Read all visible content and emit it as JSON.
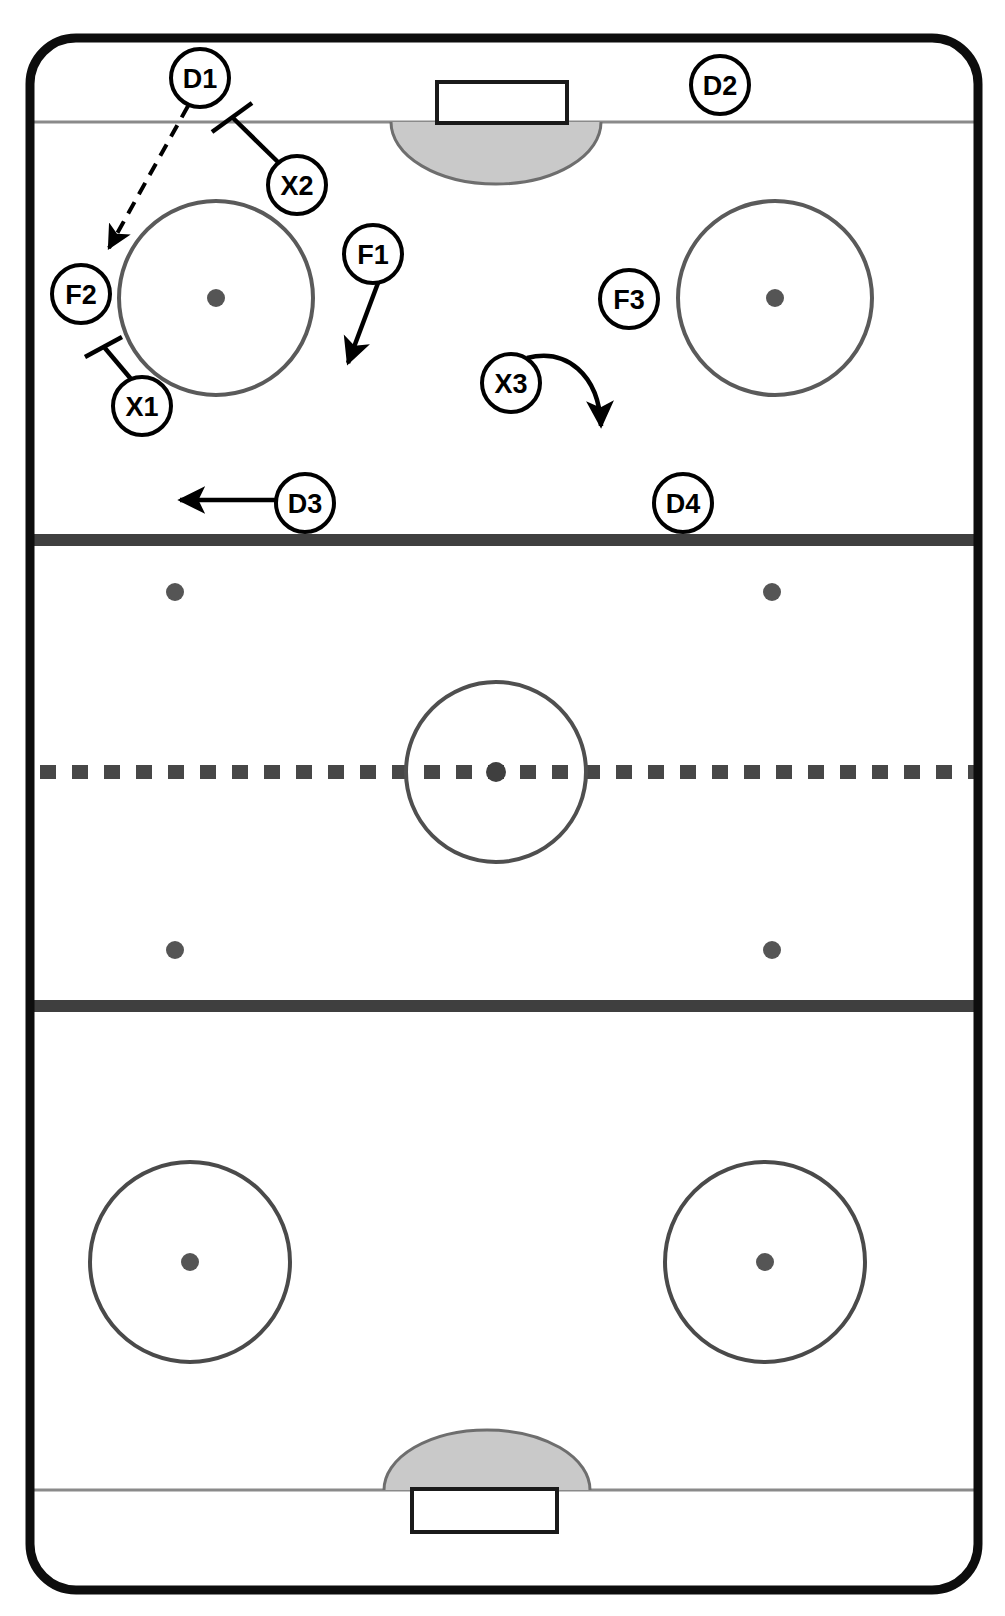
{
  "diagram": {
    "kind": "ice-hockey-rink-play-diagram",
    "title": "",
    "width": 1005,
    "height": 1616
  },
  "colors": {
    "ice": "#ffffff",
    "board": "#000000",
    "line": "#4a4a4a",
    "thin_line": "#808080",
    "crease_fill": "#c8c8c8",
    "crease_stroke": "#707070",
    "marker_stroke": "#000000",
    "marker_fill": "#ffffff",
    "dot_fill": "#555555",
    "arrow": "#000000"
  },
  "rink": {
    "boards": {
      "x": 30,
      "y": 38,
      "width": 948,
      "height": 1552,
      "corner_radius": 46,
      "stroke_width": 9
    },
    "goal_lines": [
      {
        "name": "top-goal-line",
        "y": 122
      },
      {
        "name": "bottom-goal-line",
        "y": 1490
      }
    ],
    "blue_lines": [
      {
        "name": "top-blue-line",
        "y": 540,
        "thickness": 11
      },
      {
        "name": "bottom-blue-line",
        "y": 1006,
        "thickness": 11
      }
    ],
    "center_line": {
      "name": "center-red-line",
      "y": 772,
      "thickness": 13,
      "style": "dashed"
    },
    "center_circle": {
      "cx": 496,
      "cy": 772,
      "r": 90
    },
    "center_dot": {
      "cx": 496,
      "cy": 772,
      "r": 9
    },
    "goals": [
      {
        "name": "top-goal",
        "x": 437,
        "y": 82,
        "width": 130,
        "height": 40
      },
      {
        "name": "bottom-goal",
        "x": 412,
        "y": 1490,
        "width": 145,
        "height": 42
      }
    ],
    "creases": [
      {
        "name": "top-crease",
        "cx": 496,
        "cy": 122,
        "rx": 105,
        "ry": 62,
        "side": "below"
      },
      {
        "name": "bottom-crease",
        "cx": 487,
        "cy": 1490,
        "rx": 103,
        "ry": 60,
        "side": "above"
      }
    ],
    "faceoff_circles": [
      {
        "name": "faceoff-circle-top-left",
        "cx": 216,
        "cy": 298,
        "r": 97
      },
      {
        "name": "faceoff-circle-top-right",
        "cx": 775,
        "cy": 298,
        "r": 97
      },
      {
        "name": "faceoff-circle-bottom-left",
        "cx": 190,
        "cy": 1262,
        "r": 100
      },
      {
        "name": "faceoff-circle-bottom-right",
        "cx": 765,
        "cy": 1262,
        "r": 100
      }
    ],
    "faceoff_dots": [
      {
        "name": "faceoff-dot-top-left",
        "cx": 216,
        "cy": 298,
        "r": 9
      },
      {
        "name": "faceoff-dot-top-right",
        "cx": 775,
        "cy": 298,
        "r": 9
      },
      {
        "name": "faceoff-dot-bottom-left",
        "cx": 190,
        "cy": 1262,
        "r": 9
      },
      {
        "name": "faceoff-dot-bottom-right",
        "cx": 765,
        "cy": 1262,
        "r": 9
      },
      {
        "name": "neutral-dot-top-left",
        "cx": 175,
        "cy": 592,
        "r": 9
      },
      {
        "name": "neutral-dot-top-right",
        "cx": 772,
        "cy": 592,
        "r": 9
      },
      {
        "name": "neutral-dot-bottom-left",
        "cx": 175,
        "cy": 950,
        "r": 9
      },
      {
        "name": "neutral-dot-bottom-right",
        "cx": 772,
        "cy": 950,
        "r": 9
      }
    ]
  },
  "players": [
    {
      "id": "D1",
      "label": "D1",
      "cx": 200,
      "cy": 78,
      "r": 29,
      "team": "defense"
    },
    {
      "id": "D2",
      "label": "D2",
      "cx": 720,
      "cy": 85,
      "r": 29,
      "team": "defense"
    },
    {
      "id": "D3",
      "label": "D3",
      "cx": 305,
      "cy": 503,
      "r": 29,
      "team": "defense"
    },
    {
      "id": "D4",
      "label": "D4",
      "cx": 683,
      "cy": 503,
      "r": 29,
      "team": "defense"
    },
    {
      "id": "F1",
      "label": "F1",
      "cx": 373,
      "cy": 254,
      "r": 29,
      "team": "forward"
    },
    {
      "id": "F2",
      "label": "F2",
      "cx": 81,
      "cy": 294,
      "r": 29,
      "team": "forward"
    },
    {
      "id": "F3",
      "label": "F3",
      "cx": 629,
      "cy": 299,
      "r": 29,
      "team": "forward"
    },
    {
      "id": "X1",
      "label": "X1",
      "cx": 142,
      "cy": 406,
      "r": 29,
      "team": "opponent"
    },
    {
      "id": "X2",
      "label": "X2",
      "cx": 297,
      "cy": 185,
      "r": 29,
      "team": "opponent"
    },
    {
      "id": "X3",
      "label": "X3",
      "cx": 511,
      "cy": 383,
      "r": 29,
      "team": "opponent"
    }
  ],
  "movements": [
    {
      "name": "pass-d1-to-f2",
      "from": "D1",
      "to": "F2",
      "style": "dashed",
      "meaning": "pass",
      "path": "M 188 106 L 108 250",
      "arrowhead": true
    },
    {
      "name": "check-x2-marker",
      "from": "X2",
      "style": "solid-with-tick",
      "meaning": "body-check / stick-block",
      "path": "M 278 163 L 232 117",
      "tick": "M 213 131 L 250 104",
      "arrowhead": false
    },
    {
      "name": "check-x1-marker",
      "from": "X1",
      "style": "solid-with-tick",
      "meaning": "body-check / stick-block",
      "path": "M 130 379 L 103 348",
      "tick": "M 86 356 L 121 339",
      "arrowhead": false
    },
    {
      "name": "skate-f1",
      "from": "F1",
      "style": "solid",
      "meaning": "skate",
      "path": "M 377 283 L 347 368",
      "arrowhead": true
    },
    {
      "name": "skate-x3-curve",
      "from": "X3",
      "style": "curved",
      "meaning": "skate",
      "path": "M 531 359 C 570 352 600 378 602 432",
      "arrowhead": true
    },
    {
      "name": "skate-d3",
      "from": "D3",
      "style": "solid",
      "meaning": "skate",
      "path": "M 276 500 L 176 500",
      "arrowhead": true
    }
  ],
  "legend": {
    "dashed_line_means": "pass",
    "solid_arrow_means": "skate with puck / movement",
    "tick_line_means": "check or block"
  }
}
